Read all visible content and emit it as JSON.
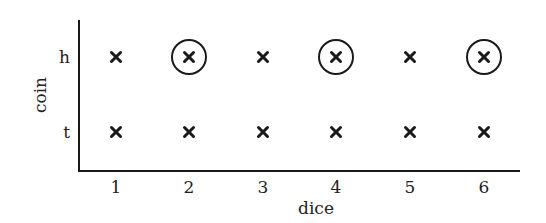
{
  "chart_data": {
    "type": "scatter",
    "title": "",
    "xlabel": "dice",
    "ylabel": "coin",
    "x_categories": [
      "1",
      "2",
      "3",
      "4",
      "5",
      "6"
    ],
    "y_categories": [
      "t",
      "h"
    ],
    "points": [
      {
        "dice": "1",
        "coin": "h",
        "marker": "x",
        "circled": false
      },
      {
        "dice": "2",
        "coin": "h",
        "marker": "x",
        "circled": true
      },
      {
        "dice": "3",
        "coin": "h",
        "marker": "x",
        "circled": false
      },
      {
        "dice": "4",
        "coin": "h",
        "marker": "x",
        "circled": true
      },
      {
        "dice": "5",
        "coin": "h",
        "marker": "x",
        "circled": false
      },
      {
        "dice": "6",
        "coin": "h",
        "marker": "x",
        "circled": true
      },
      {
        "dice": "1",
        "coin": "t",
        "marker": "x",
        "circled": false
      },
      {
        "dice": "2",
        "coin": "t",
        "marker": "x",
        "circled": false
      },
      {
        "dice": "3",
        "coin": "t",
        "marker": "x",
        "circled": false
      },
      {
        "dice": "4",
        "coin": "t",
        "marker": "x",
        "circled": false
      },
      {
        "dice": "5",
        "coin": "t",
        "marker": "x",
        "circled": false
      },
      {
        "dice": "6",
        "coin": "t",
        "marker": "x",
        "circled": false
      }
    ],
    "grid": false,
    "legend": null
  },
  "axes": {
    "x_label": "dice",
    "y_label": "coin",
    "x_ticks": [
      "1",
      "2",
      "3",
      "4",
      "5",
      "6"
    ],
    "y_ticks": [
      "h",
      "t"
    ]
  },
  "colors": {
    "ink": "#1a1a1a",
    "background": "#ffffff"
  }
}
